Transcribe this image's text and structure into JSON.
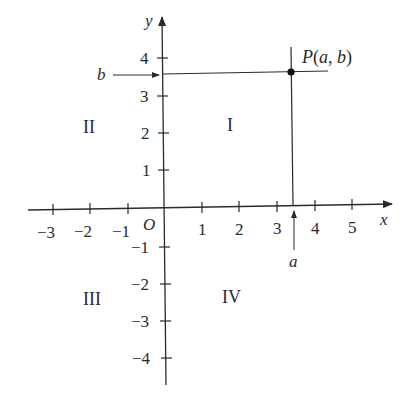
{
  "figure": {
    "axis_labels": {
      "x": "x",
      "y": "y",
      "origin": "O"
    },
    "x_ticks": [
      "−3",
      "−2",
      "−1",
      "1",
      "2",
      "3",
      "4",
      "5"
    ],
    "y_ticks": [
      "4",
      "3",
      "2",
      "1",
      "−1",
      "−2",
      "−3",
      "−4"
    ],
    "quadrants": {
      "I": "I",
      "II": "II",
      "III": "III",
      "IV": "IV"
    },
    "point": {
      "label": "P(a, b)",
      "a_label": "a",
      "b_label": "b",
      "a": 3.4,
      "b": 3.6
    },
    "colors": {
      "ink": "#2a2a2a",
      "background": "#ffffff"
    }
  }
}
